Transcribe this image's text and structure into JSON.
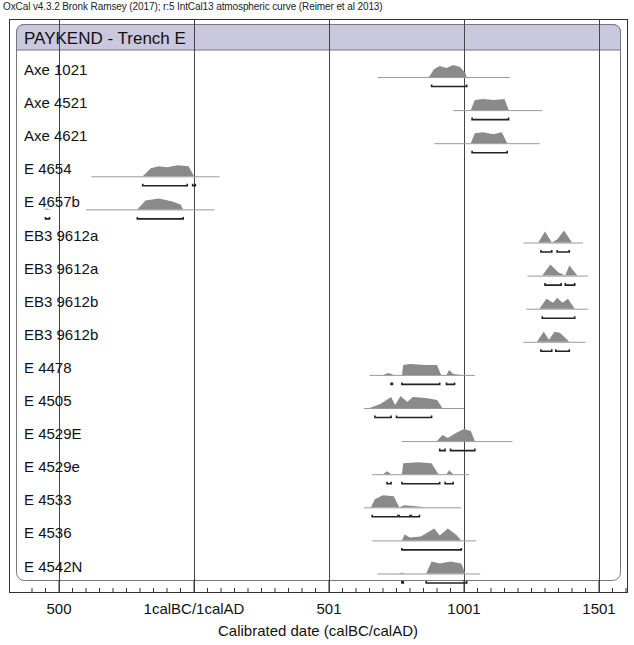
{
  "caption": "OxCal v4.3.2 Bronk Ramsey (2017); r:5 IntCal13 atmospheric curve (Reimer et al 2013)",
  "colors": {
    "header_band": "#c9c8de",
    "distribution_fill": "#8a8a8a",
    "prior_line": "#9a9a9a",
    "frame": "#333333",
    "range_bar": "#222222"
  },
  "chart_data": {
    "type": "area",
    "title": "PAYKEND - Trench E",
    "xlabel": "Calibrated date (calBC/calAD)",
    "ylabel": "",
    "xlim": [
      -630,
      1610
    ],
    "x_ticks": [
      {
        "value": -500,
        "label": "500"
      },
      {
        "value": 0,
        "label": "1calBC/1calAD"
      },
      {
        "value": 500,
        "label": "501"
      },
      {
        "value": 1000,
        "label": "1001"
      },
      {
        "value": 1500,
        "label": "1501"
      }
    ],
    "minor_tick_step": 50,
    "grid": "vertical lines at major ticks",
    "legend": "none",
    "series": [
      {
        "name": "Axe 1021",
        "line": [
          680,
          1170
        ],
        "peaks": [
          [
            870,
            0
          ],
          [
            890,
            8
          ],
          [
            910,
            11
          ],
          [
            935,
            9
          ],
          [
            960,
            12
          ],
          [
            985,
            10
          ],
          [
            1005,
            4
          ],
          [
            1010,
            0
          ]
        ],
        "ranges": [
          [
            880,
            1010
          ]
        ]
      },
      {
        "name": "Axe 4521",
        "line": [
          960,
          1290
        ],
        "peaks": [
          [
            1025,
            0
          ],
          [
            1040,
            10
          ],
          [
            1070,
            11
          ],
          [
            1110,
            10
          ],
          [
            1150,
            11
          ],
          [
            1165,
            0
          ]
        ],
        "ranges": [
          [
            1030,
            1165
          ]
        ]
      },
      {
        "name": "Axe 4621",
        "line": [
          890,
          1280
        ],
        "peaks": [
          [
            1025,
            0
          ],
          [
            1040,
            10
          ],
          [
            1070,
            11
          ],
          [
            1110,
            9
          ],
          [
            1140,
            11
          ],
          [
            1160,
            0
          ]
        ],
        "ranges": [
          [
            1030,
            1160
          ]
        ]
      },
      {
        "name": "E 4654",
        "line": [
          -380,
          95
        ],
        "peaks": [
          [
            -190,
            0
          ],
          [
            -160,
            8
          ],
          [
            -130,
            10
          ],
          [
            -100,
            9
          ],
          [
            -60,
            11
          ],
          [
            -20,
            10
          ],
          [
            0,
            0
          ]
        ],
        "ranges": [
          [
            -190,
            -25
          ],
          [
            -5,
            5
          ]
        ]
      },
      {
        "name": "E 4657b",
        "line": [
          -400,
          75
        ],
        "peaks": [
          [
            -560,
            0
          ],
          [
            -545,
            1
          ],
          [
            -530,
            0
          ],
          [
            -210,
            0
          ],
          [
            -180,
            9
          ],
          [
            -130,
            11
          ],
          [
            -80,
            8
          ],
          [
            -50,
            5
          ],
          [
            -40,
            0
          ]
        ],
        "ranges": [
          [
            -550,
            -535
          ],
          [
            -210,
            -40
          ]
        ]
      },
      {
        "name": "EB3 9612a",
        "line": [
          1220,
          1440
        ],
        "peaks": [
          [
            1275,
            0
          ],
          [
            1300,
            11
          ],
          [
            1325,
            0
          ],
          [
            1345,
            3
          ],
          [
            1370,
            12
          ],
          [
            1400,
            0
          ]
        ],
        "ranges": [
          [
            1285,
            1325
          ],
          [
            1345,
            1390
          ]
        ]
      },
      {
        "name": "EB3 9612a",
        "line": [
          1235,
          1460
        ],
        "peaks": [
          [
            1290,
            0
          ],
          [
            1320,
            11
          ],
          [
            1350,
            3
          ],
          [
            1375,
            0
          ],
          [
            1390,
            10
          ],
          [
            1420,
            0
          ]
        ],
        "ranges": [
          [
            1300,
            1360
          ],
          [
            1375,
            1410
          ]
        ]
      },
      {
        "name": "EB3 9612b",
        "line": [
          1230,
          1460
        ],
        "peaks": [
          [
            1280,
            0
          ],
          [
            1305,
            10
          ],
          [
            1330,
            6
          ],
          [
            1345,
            11
          ],
          [
            1365,
            6
          ],
          [
            1385,
            10
          ],
          [
            1410,
            0
          ]
        ],
        "ranges": [
          [
            1290,
            1410
          ]
        ]
      },
      {
        "name": "EB3 9612b",
        "line": [
          1220,
          1450
        ],
        "peaks": [
          [
            1270,
            0
          ],
          [
            1295,
            10
          ],
          [
            1315,
            2
          ],
          [
            1335,
            10
          ],
          [
            1355,
            9
          ],
          [
            1390,
            0
          ]
        ],
        "ranges": [
          [
            1285,
            1325
          ],
          [
            1340,
            1390
          ]
        ]
      },
      {
        "name": "E 4478",
        "line": [
          650,
          1040
        ],
        "peaks": [
          [
            700,
            0
          ],
          [
            720,
            2
          ],
          [
            740,
            0
          ],
          [
            770,
            0
          ],
          [
            775,
            10
          ],
          [
            800,
            11
          ],
          [
            860,
            10
          ],
          [
            900,
            10
          ],
          [
            915,
            0
          ],
          [
            935,
            0
          ],
          [
            945,
            5
          ],
          [
            960,
            1
          ],
          [
            990,
            0
          ]
        ],
        "ranges": [
          [
            730,
            735
          ],
          [
            770,
            910
          ],
          [
            935,
            965
          ]
        ]
      },
      {
        "name": "E 4505",
        "line": [
          630,
          1000
        ],
        "peaks": [
          [
            650,
            0
          ],
          [
            690,
            4
          ],
          [
            730,
            11
          ],
          [
            745,
            3
          ],
          [
            765,
            12
          ],
          [
            790,
            6
          ],
          [
            810,
            11
          ],
          [
            860,
            10
          ],
          [
            900,
            8
          ],
          [
            920,
            0
          ]
        ],
        "ranges": [
          [
            670,
            730
          ],
          [
            750,
            880
          ]
        ]
      },
      {
        "name": "E 4529E",
        "line": [
          770,
          1180
        ],
        "peaks": [
          [
            900,
            0
          ],
          [
            920,
            6
          ],
          [
            940,
            3
          ],
          [
            970,
            8
          ],
          [
            1000,
            12
          ],
          [
            1025,
            10
          ],
          [
            1040,
            0
          ]
        ],
        "ranges": [
          [
            910,
            930
          ],
          [
            950,
            1040
          ]
        ]
      },
      {
        "name": "E 4529e",
        "line": [
          660,
          1020
        ],
        "peaks": [
          [
            700,
            0
          ],
          [
            715,
            3
          ],
          [
            730,
            0
          ],
          [
            770,
            0
          ],
          [
            775,
            11
          ],
          [
            830,
            12
          ],
          [
            880,
            11
          ],
          [
            905,
            0
          ],
          [
            935,
            0
          ],
          [
            945,
            4
          ],
          [
            960,
            0
          ]
        ],
        "ranges": [
          [
            715,
            730
          ],
          [
            770,
            910
          ],
          [
            930,
            960
          ]
        ]
      },
      {
        "name": "E 4533",
        "line": [
          630,
          990
        ],
        "peaks": [
          [
            655,
            0
          ],
          [
            670,
            8
          ],
          [
            700,
            12
          ],
          [
            740,
            11
          ],
          [
            760,
            0
          ],
          [
            780,
            2
          ],
          [
            820,
            1
          ],
          [
            860,
            0
          ]
        ],
        "ranges": [
          [
            660,
            755
          ],
          [
            760,
            800
          ],
          [
            805,
            835
          ]
        ]
      },
      {
        "name": "E 4536",
        "line": [
          660,
          1045
        ],
        "peaks": [
          [
            770,
            0
          ],
          [
            780,
            6
          ],
          [
            800,
            3
          ],
          [
            840,
            4
          ],
          [
            890,
            12
          ],
          [
            910,
            5
          ],
          [
            940,
            12
          ],
          [
            970,
            6
          ],
          [
            990,
            0
          ]
        ],
        "ranges": [
          [
            770,
            990
          ]
        ]
      },
      {
        "name": "E 4542N",
        "line": [
          680,
          1060
        ],
        "peaks": [
          [
            760,
            0
          ],
          [
            770,
            1
          ],
          [
            780,
            0
          ],
          [
            860,
            0
          ],
          [
            880,
            12
          ],
          [
            910,
            10
          ],
          [
            950,
            12
          ],
          [
            990,
            10
          ],
          [
            1005,
            0
          ]
        ],
        "ranges": [
          [
            770,
            775
          ],
          [
            860,
            1010
          ]
        ]
      }
    ]
  }
}
